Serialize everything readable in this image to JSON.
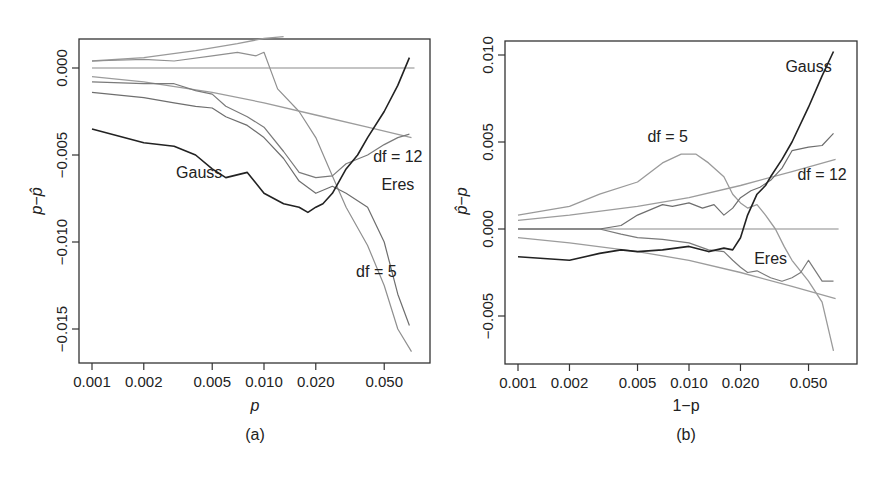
{
  "chart_data": [
    {
      "panel": "(a)",
      "type": "line",
      "xscale": "log",
      "xlabel": "p",
      "ylabel": "p − p̂",
      "xlim": [
        0.00085,
        0.085
      ],
      "ylim": [
        -0.0168,
        0.0017
      ],
      "xticks": [
        0.001,
        0.002,
        0.005,
        0.01,
        0.02,
        0.05
      ],
      "xtick_labels": [
        "0.001",
        "0.002",
        "0.005",
        "0.010",
        "0.020",
        "0.050"
      ],
      "yticks": [
        0.0,
        -0.005,
        -0.01,
        -0.015
      ],
      "ytick_labels": [
        "0.000",
        "−0.005",
        "−0.010",
        "−0.015"
      ],
      "grid": false,
      "series": [
        {
          "name": "zero-reference",
          "color": "#8a8a8a",
          "width": 1.2,
          "x": [
            0.001,
            0.075
          ],
          "y": [
            0.0,
            0.0
          ]
        },
        {
          "name": "upper-smooth",
          "color": "#9a9a9a",
          "width": 1.3,
          "x": [
            0.001,
            0.002,
            0.004,
            0.007,
            0.01,
            0.013
          ],
          "y": [
            0.0004,
            0.0006,
            0.001,
            0.0014,
            0.0017,
            0.0018
          ]
        },
        {
          "name": "upper-noisy",
          "color": "#8f8f8f",
          "width": 1.2,
          "x": [
            0.001,
            0.002,
            0.003,
            0.005,
            0.007,
            0.009,
            0.01,
            0.012,
            0.016,
            0.02,
            0.025,
            0.03,
            0.04,
            0.05,
            0.06,
            0.072
          ],
          "y": [
            0.0004,
            0.0005,
            0.0004,
            0.0007,
            0.0009,
            0.0007,
            0.0009,
            -0.0012,
            -0.0025,
            -0.004,
            -0.0062,
            -0.008,
            -0.0102,
            -0.0125,
            -0.015,
            -0.0163
          ]
        },
        {
          "name": "df = 12 (smooth)",
          "color": "#9c9c9c",
          "width": 1.3,
          "x": [
            0.001,
            0.002,
            0.005,
            0.01,
            0.02,
            0.04,
            0.072
          ],
          "y": [
            -0.0005,
            -0.0008,
            -0.0014,
            -0.002,
            -0.0027,
            -0.0034,
            -0.004
          ]
        },
        {
          "name": "df = 12",
          "color": "#7a7a7a",
          "width": 1.2,
          "x": [
            0.001,
            0.002,
            0.003,
            0.004,
            0.005,
            0.006,
            0.008,
            0.01,
            0.013,
            0.016,
            0.02,
            0.025,
            0.03,
            0.04,
            0.05,
            0.06,
            0.07
          ],
          "y": [
            -0.0008,
            -0.0009,
            -0.0009,
            -0.0013,
            -0.0015,
            -0.0022,
            -0.0028,
            -0.0034,
            -0.0048,
            -0.006,
            -0.0063,
            -0.0062,
            -0.0055,
            -0.005,
            -0.0044,
            -0.004,
            -0.0038
          ]
        },
        {
          "name": "Eres",
          "color": "#6e6e6e",
          "width": 1.2,
          "x": [
            0.001,
            0.002,
            0.003,
            0.004,
            0.005,
            0.006,
            0.008,
            0.01,
            0.013,
            0.016,
            0.02,
            0.025,
            0.03,
            0.04,
            0.05,
            0.06,
            0.07
          ],
          "y": [
            -0.0014,
            -0.0017,
            -0.002,
            -0.0022,
            -0.0023,
            -0.0028,
            -0.0033,
            -0.004,
            -0.0052,
            -0.0065,
            -0.0072,
            -0.0068,
            -0.0072,
            -0.008,
            -0.01,
            -0.013,
            -0.0148
          ]
        },
        {
          "name": "Gauss",
          "color": "#222222",
          "width": 1.6,
          "x": [
            0.001,
            0.002,
            0.003,
            0.004,
            0.005,
            0.006,
            0.008,
            0.01,
            0.013,
            0.016,
            0.018,
            0.02,
            0.022,
            0.025,
            0.03,
            0.035,
            0.04,
            0.05,
            0.06,
            0.07
          ],
          "y": [
            -0.0035,
            -0.0043,
            -0.0045,
            -0.005,
            -0.0058,
            -0.0063,
            -0.006,
            -0.0072,
            -0.0078,
            -0.008,
            -0.0083,
            -0.008,
            -0.0078,
            -0.0072,
            -0.0058,
            -0.005,
            -0.004,
            -0.0025,
            -0.001,
            0.0006
          ]
        }
      ],
      "annotations": [
        {
          "text": "Gauss",
          "x": 0.0042,
          "y": -0.0063
        },
        {
          "text": "df = 12",
          "x": 0.06,
          "y": -0.0054
        },
        {
          "text": "Eres",
          "x": 0.06,
          "y": -0.007
        },
        {
          "text": "df = 5",
          "x": 0.045,
          "y": -0.012
        }
      ],
      "caption": "(a)"
    },
    {
      "panel": "(b)",
      "type": "line",
      "xscale": "log",
      "xlabel": "1−p",
      "ylabel": "p̂ − p",
      "xlim": [
        0.00085,
        0.085
      ],
      "ylim": [
        -0.0078,
        0.0107
      ],
      "xticks": [
        0.001,
        0.002,
        0.005,
        0.01,
        0.02,
        0.05
      ],
      "xtick_labels": [
        "0.001",
        "0.002",
        "0.005",
        "0.010",
        "0.020",
        "0.050"
      ],
      "yticks": [
        0.01,
        0.005,
        0.0,
        -0.005
      ],
      "ytick_labels": [
        "0.010",
        "0.005",
        "0.000",
        "−0.005"
      ],
      "grid": false,
      "series": [
        {
          "name": "zero-reference",
          "color": "#8a8a8a",
          "width": 1.2,
          "x": [
            0.001,
            0.075
          ],
          "y": [
            0.0,
            0.0
          ]
        },
        {
          "name": "df = 5",
          "color": "#9a9a9a",
          "width": 1.3,
          "x": [
            0.001,
            0.002,
            0.003,
            0.005,
            0.007,
            0.009,
            0.011,
            0.013,
            0.016,
            0.018,
            0.02,
            0.022,
            0.025,
            0.028,
            0.032,
            0.036,
            0.04,
            0.05,
            0.06,
            0.07
          ],
          "y": [
            0.0008,
            0.0013,
            0.002,
            0.0027,
            0.0038,
            0.0043,
            0.0043,
            0.0038,
            0.003,
            0.002,
            0.0015,
            0.0012,
            0.0014,
            0.0008,
            0.0,
            -0.001,
            -0.0018,
            -0.003,
            -0.0042,
            -0.007
          ]
        },
        {
          "name": "df = 12 (smooth)",
          "color": "#9c9c9c",
          "width": 1.3,
          "x": [
            0.001,
            0.002,
            0.005,
            0.01,
            0.02,
            0.04,
            0.072
          ],
          "y": [
            0.0005,
            0.0008,
            0.0013,
            0.0018,
            0.0025,
            0.0033,
            0.004
          ]
        },
        {
          "name": "df = 12",
          "color": "#6e6e6e",
          "width": 1.2,
          "x": [
            0.001,
            0.002,
            0.003,
            0.004,
            0.005,
            0.007,
            0.008,
            0.01,
            0.012,
            0.014,
            0.016,
            0.018,
            0.02,
            0.023,
            0.026,
            0.03,
            0.035,
            0.04,
            0.05,
            0.06,
            0.07
          ],
          "y": [
            0.0,
            0.0,
            0.0,
            0.0002,
            0.0008,
            0.0014,
            0.0013,
            0.0015,
            0.0012,
            0.0014,
            0.0008,
            0.0012,
            0.0018,
            0.0022,
            0.0024,
            0.0028,
            0.0035,
            0.0045,
            0.0047,
            0.0048,
            0.0055
          ]
        },
        {
          "name": "Eres",
          "color": "#7a7a7a",
          "width": 1.2,
          "x": [
            0.001,
            0.002,
            0.003,
            0.004,
            0.005,
            0.007,
            0.01,
            0.013,
            0.016,
            0.018,
            0.02,
            0.022,
            0.025,
            0.03,
            0.035,
            0.04,
            0.045,
            0.05,
            0.06,
            0.07
          ],
          "y": [
            0.0,
            0.0,
            0.0,
            -0.0003,
            -0.0005,
            -0.0006,
            -0.0008,
            -0.0012,
            -0.0013,
            -0.0018,
            -0.0022,
            -0.0025,
            -0.0024,
            -0.0028,
            -0.003,
            -0.0028,
            -0.0025,
            -0.0018,
            -0.003,
            -0.003
          ]
        },
        {
          "name": "Eres (smooth)",
          "color": "#9c9c9c",
          "width": 1.3,
          "x": [
            0.001,
            0.002,
            0.005,
            0.01,
            0.02,
            0.04,
            0.072
          ],
          "y": [
            -0.0005,
            -0.0008,
            -0.0013,
            -0.0018,
            -0.0025,
            -0.0033,
            -0.004
          ]
        },
        {
          "name": "Gauss",
          "color": "#222222",
          "width": 1.6,
          "x": [
            0.001,
            0.002,
            0.003,
            0.004,
            0.005,
            0.007,
            0.01,
            0.013,
            0.016,
            0.018,
            0.02,
            0.022,
            0.025,
            0.028,
            0.03,
            0.035,
            0.04,
            0.05,
            0.06,
            0.07
          ],
          "y": [
            -0.0016,
            -0.0018,
            -0.0014,
            -0.0012,
            -0.0013,
            -0.0012,
            -0.001,
            -0.0013,
            -0.0011,
            -0.0012,
            -0.0005,
            0.0008,
            0.002,
            0.0025,
            0.003,
            0.004,
            0.005,
            0.007,
            0.0088,
            0.0102
          ]
        }
      ],
      "annotations": [
        {
          "text": "Gauss",
          "x": 0.05,
          "y": 0.009
        },
        {
          "text": "df = 5",
          "x": 0.0075,
          "y": 0.005
        },
        {
          "text": "df = 12",
          "x": 0.06,
          "y": 0.0028
        },
        {
          "text": "Eres",
          "x": 0.03,
          "y": -0.002
        }
      ],
      "caption": "(b)"
    }
  ],
  "panels": {
    "a": {
      "caption": "(a)",
      "xlabel": "p",
      "ylabel_main": "p",
      "ylabel_sep": "−",
      "ylabel_hat": "p̂"
    },
    "b": {
      "caption": "(b)",
      "xlabel": "1−p",
      "ylabel_hat": "p̂",
      "ylabel_sep": "−",
      "ylabel_main": "p"
    }
  }
}
